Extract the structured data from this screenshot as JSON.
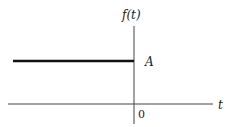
{
  "diagram": {
    "y_axis_label": "f(t)",
    "x_axis_label": "t",
    "origin_label": "0",
    "level_label": "A"
  },
  "colors": {
    "axis": "#333333",
    "signal": "#111111",
    "background": "#ffffff"
  }
}
